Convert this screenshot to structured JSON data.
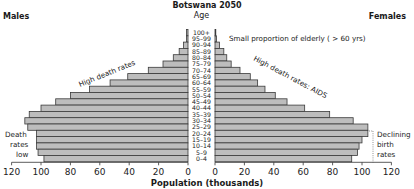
{
  "chart_data": {
    "type": "bar",
    "subtype": "population-pyramid",
    "title": "Botswana 2050",
    "xlabel": "Population (thousands)",
    "age_header": "Age",
    "left_label": "Males",
    "right_label": "Females",
    "categories": [
      "100+",
      "95–99",
      "90–94",
      "85–89",
      "80–84",
      "75–79",
      "70–74",
      "65–69",
      "60–64",
      "55–59",
      "50–54",
      "45–49",
      "40–44",
      "35–39",
      "30–34",
      "25–29",
      "20–24",
      "15–19",
      "10–14",
      "5–9",
      "0–4"
    ],
    "series": [
      {
        "name": "Males",
        "side": "left",
        "values": [
          1,
          1,
          3,
          6,
          10,
          17,
          27,
          41,
          53,
          67,
          80,
          90,
          100,
          108,
          111,
          109,
          103,
          103,
          103,
          102,
          98
        ]
      },
      {
        "name": "Females",
        "side": "right",
        "values": [
          0.5,
          1,
          3,
          6,
          8,
          11,
          17,
          24,
          29,
          34,
          41,
          49,
          61,
          78,
          94,
          104,
          104,
          100,
          98,
          97,
          93
        ]
      }
    ],
    "x_ticks_left": [
      120,
      100,
      80,
      60,
      40,
      20,
      0
    ],
    "x_ticks_right": [
      0,
      20,
      40,
      60,
      80,
      100,
      120
    ],
    "xlim": [
      0,
      120
    ],
    "grid": false,
    "annotations": [
      {
        "text": "Small proportion of elderly ( > 60 yrs)",
        "side": "right"
      },
      {
        "text": "High death rates",
        "side": "left"
      },
      {
        "text": "High death rates: AIDS",
        "side": "right"
      },
      {
        "text": "Death rates low",
        "lines": [
          "Death",
          "rates",
          "low"
        ],
        "side": "left"
      },
      {
        "text": "Declining birth rates",
        "lines": [
          "Declining",
          "birth",
          "rates"
        ],
        "side": "right"
      }
    ]
  },
  "colors": {
    "bar_fill": "#bdbdbd",
    "bar_stroke": "#3a3a3a",
    "text": "#1a1a1a"
  }
}
